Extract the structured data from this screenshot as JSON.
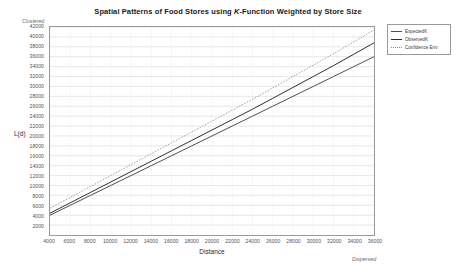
{
  "chart_data": {
    "type": "line",
    "title": "Spatial Patterns of Food Stores using K-Function Weighted by Store Size",
    "title_part1": "Spatial Patterns of Food Stores using ",
    "title_italic": "K",
    "title_part2": "-Function Weighted by Store Size",
    "xlabel": "Distance",
    "ylabel": "L(d)",
    "top_annotation": "Clustered",
    "bottom_annotation": "Dispersed",
    "xlim": [
      4000,
      36000
    ],
    "ylim": [
      0,
      42000
    ],
    "grid": true,
    "legend_position": "top-right",
    "xticks": [
      4000,
      6000,
      8000,
      10000,
      12000,
      14000,
      16000,
      18000,
      20000,
      22000,
      24000,
      26000,
      28000,
      30000,
      32000,
      34000,
      36000
    ],
    "xtick_labels": [
      "4000",
      "6000",
      "8000",
      "10000",
      "12000",
      "14000",
      "16000",
      "18000",
      "20000",
      "22000",
      "24000",
      "26000",
      "28000",
      "30000",
      "32000",
      "34000",
      "36000"
    ],
    "yticks": [
      2000,
      4000,
      6000,
      8000,
      10000,
      12000,
      14000,
      16000,
      18000,
      20000,
      22000,
      24000,
      26000,
      28000,
      30000,
      32000,
      34000,
      36000,
      38000,
      40000,
      42000
    ],
    "ytick_labels": [
      "2000",
      "4000",
      "6000",
      "8000",
      "10000",
      "12000",
      "14000",
      "16000",
      "18000",
      "20000",
      "22000",
      "24000",
      "26000",
      "28000",
      "30000",
      "32000",
      "34000",
      "36000",
      "38000",
      "40000",
      "42000"
    ],
    "x": [
      4000,
      6000,
      8000,
      10000,
      12000,
      14000,
      16000,
      18000,
      20000,
      22000,
      24000,
      26000,
      28000,
      30000,
      32000,
      34000,
      36000
    ],
    "series": [
      {
        "name": "ExpectedK",
        "color": "#4d4d4d",
        "style": "solid",
        "values": [
          4000,
          6000,
          8000,
          10000,
          12000,
          14000,
          16000,
          18000,
          20000,
          22000,
          24000,
          26000,
          28000,
          30000,
          32000,
          34000,
          36000
        ]
      },
      {
        "name": "ObservedK",
        "color": "#2e2e2e",
        "style": "solid",
        "values": [
          4400,
          6500,
          8600,
          10700,
          12800,
          14900,
          17000,
          19100,
          21200,
          23300,
          25400,
          27600,
          29800,
          32000,
          34200,
          36500,
          38800
        ]
      },
      {
        "name": "Confidence Env",
        "color": "#8c8c8c",
        "style": "dotted",
        "values": [
          5400,
          7600,
          9800,
          12000,
          14200,
          16400,
          18600,
          20800,
          23000,
          25200,
          27400,
          29700,
          32000,
          34300,
          36600,
          39000,
          41400
        ]
      }
    ]
  },
  "legend": {
    "items": [
      {
        "label": "ExpectedK"
      },
      {
        "label": "ObservedK"
      },
      {
        "label": "Confidence Env"
      }
    ]
  }
}
